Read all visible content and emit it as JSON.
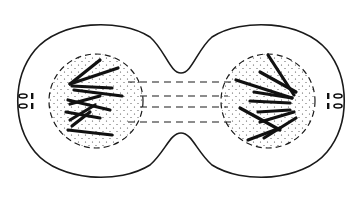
{
  "diagram": {
    "type": "cell-division-illustration",
    "colors": {
      "background": "#ffffff",
      "ink": "#1a1a1a",
      "stipple": "#333333"
    },
    "parts": [
      {
        "name": "cell-membrane",
        "label": ""
      },
      {
        "name": "left-nucleus",
        "label": ""
      },
      {
        "name": "right-nucleus",
        "label": ""
      },
      {
        "name": "spindle-fibers",
        "label": ""
      },
      {
        "name": "left-centrioles",
        "label": ""
      },
      {
        "name": "right-centrioles",
        "label": ""
      }
    ]
  }
}
